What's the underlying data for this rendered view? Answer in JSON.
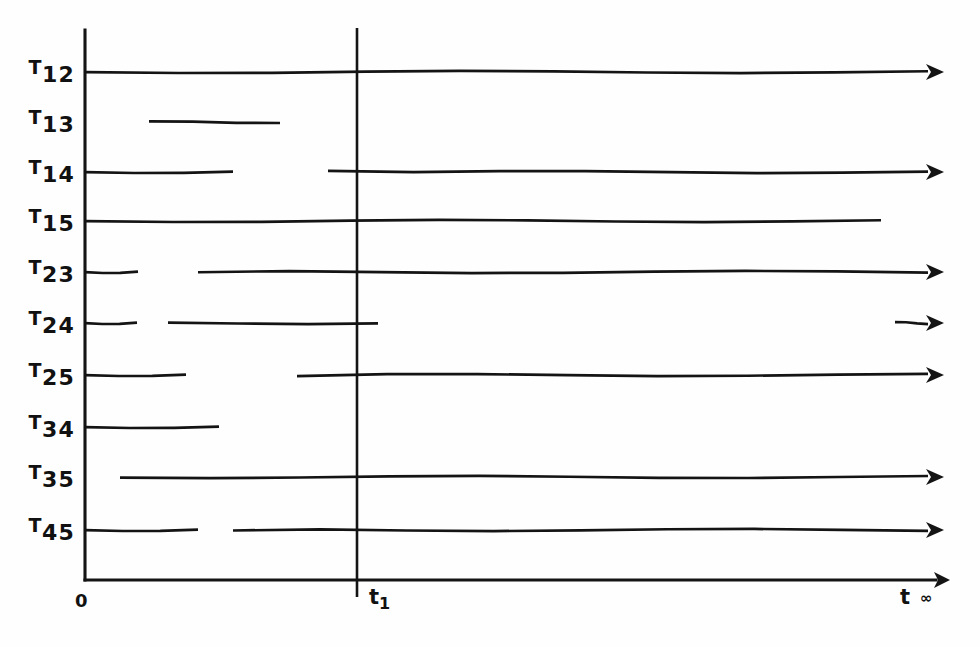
{
  "figure": {
    "background_color": "#fefefe",
    "ink_color": "#141414",
    "axis": {
      "origin_label": "0",
      "vertical_axis_x": 85,
      "vertical_axis_top_y": 30,
      "vertical_axis_bottom_y": 580,
      "horizontal_axis_y": 580,
      "horizontal_axis_start_x": 85,
      "horizontal_axis_end_x": 950,
      "time_label": "t",
      "infinity_label": "∞",
      "marker_label_base": "t",
      "marker_label_sub": "1",
      "marker_x": 357,
      "marker_top_y": 28,
      "marker_bottom_y": 597
    }
  },
  "chart_data": {
    "type": "timing-diagram",
    "title": "",
    "xlabel": "t",
    "ylabel": "",
    "x_tick_labels": [
      "0",
      "t1",
      "t ∞"
    ],
    "grid": false,
    "legend": "none",
    "axis_x_range_px": [
      85,
      950
    ],
    "marker_line_x_px": 357,
    "rows": [
      {
        "base": "T",
        "sub": "12",
        "label": "T12",
        "y": 72,
        "segments": [
          {
            "x1": 85,
            "x2": 944,
            "arrow": true
          }
        ]
      },
      {
        "base": "T",
        "sub": "13",
        "label": "T13",
        "y": 122,
        "segments": [
          {
            "x1": 149,
            "x2": 280,
            "arrow": false
          }
        ]
      },
      {
        "base": "T",
        "sub": "14",
        "label": "T14",
        "y": 172,
        "segments": [
          {
            "x1": 85,
            "x2": 233,
            "arrow": false
          },
          {
            "x1": 328,
            "x2": 944,
            "arrow": true
          }
        ]
      },
      {
        "base": "T",
        "sub": "15",
        "label": "T15",
        "y": 221,
        "segments": [
          {
            "x1": 85,
            "x2": 881,
            "arrow": false
          }
        ]
      },
      {
        "base": "T",
        "sub": "23",
        "label": "T23",
        "y": 272,
        "segments": [
          {
            "x1": 85,
            "x2": 138,
            "arrow": false
          },
          {
            "x1": 198,
            "x2": 944,
            "arrow": true
          }
        ]
      },
      {
        "base": "T",
        "sub": "24",
        "label": "T24",
        "y": 323,
        "segments": [
          {
            "x1": 85,
            "x2": 137,
            "arrow": false
          },
          {
            "x1": 168,
            "x2": 378,
            "arrow": false
          },
          {
            "x1": 895,
            "x2": 944,
            "arrow": true
          }
        ]
      },
      {
        "base": "T",
        "sub": "25",
        "label": "T25",
        "y": 375,
        "segments": [
          {
            "x1": 85,
            "x2": 186,
            "arrow": false
          },
          {
            "x1": 297,
            "x2": 944,
            "arrow": true
          }
        ]
      },
      {
        "base": "T",
        "sub": "34",
        "label": "T34",
        "y": 427,
        "segments": [
          {
            "x1": 85,
            "x2": 219,
            "arrow": false
          }
        ]
      },
      {
        "base": "T",
        "sub": "35",
        "label": "T35",
        "y": 477,
        "segments": [
          {
            "x1": 120,
            "x2": 944,
            "arrow": true
          }
        ]
      },
      {
        "base": "T",
        "sub": "45",
        "label": "T45",
        "y": 530,
        "segments": [
          {
            "x1": 85,
            "x2": 198,
            "arrow": false
          },
          {
            "x1": 233,
            "x2": 944,
            "arrow": true
          }
        ]
      }
    ]
  }
}
